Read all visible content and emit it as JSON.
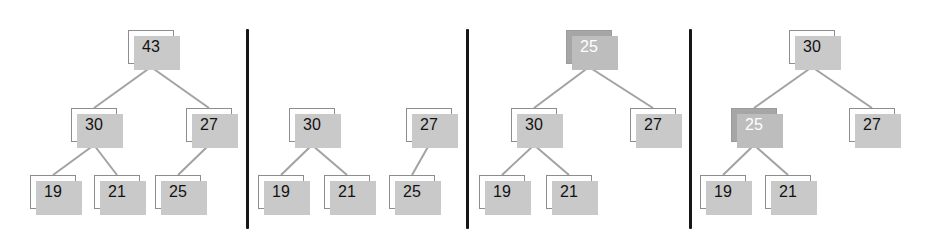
{
  "figure": {
    "title": "",
    "background_color": "#ffffff",
    "width": 935,
    "height": 239,
    "panel_count": 4,
    "divider_color": "#161616",
    "node_fill": "#fefefe",
    "node_border": "#8d8d8d",
    "node_shadow": "#c9c9c9",
    "highlight_fill": "#a6a6a6",
    "highlight_text": "#ffffff",
    "edge_color": "#a2a2a2"
  },
  "panels": [
    {
      "name": "panel-1-original-heap",
      "nodes": [
        {
          "id": "p1-43",
          "label": "43",
          "x": 128,
          "y": 30,
          "highlight": false
        },
        {
          "id": "p1-30",
          "label": "30",
          "x": 71,
          "y": 108,
          "highlight": false
        },
        {
          "id": "p1-27",
          "label": "27",
          "x": 186,
          "y": 108,
          "highlight": false
        },
        {
          "id": "p1-19",
          "label": "19",
          "x": 30,
          "y": 175,
          "highlight": false
        },
        {
          "id": "p1-21",
          "label": "21",
          "x": 94,
          "y": 175,
          "highlight": false
        },
        {
          "id": "p1-25",
          "label": "25",
          "x": 155,
          "y": 175,
          "highlight": false
        }
      ],
      "edges": [
        {
          "from": "p1-43",
          "to": "p1-30"
        },
        {
          "from": "p1-43",
          "to": "p1-27"
        },
        {
          "from": "p1-30",
          "to": "p1-19"
        },
        {
          "from": "p1-30",
          "to": "p1-21"
        },
        {
          "from": "p1-27",
          "to": "p1-25"
        }
      ]
    },
    {
      "name": "panel-2-root-removed",
      "nodes": [
        {
          "id": "p2-30",
          "label": "30",
          "x": 289,
          "y": 108,
          "highlight": false
        },
        {
          "id": "p2-27",
          "label": "27",
          "x": 406,
          "y": 108,
          "highlight": false
        },
        {
          "id": "p2-19",
          "label": "19",
          "x": 258,
          "y": 175,
          "highlight": false
        },
        {
          "id": "p2-21",
          "label": "21",
          "x": 324,
          "y": 175,
          "highlight": false
        },
        {
          "id": "p2-25",
          "label": "25",
          "x": 389,
          "y": 175,
          "highlight": false
        }
      ],
      "edges": [
        {
          "from": "p2-30",
          "to": "p2-19"
        },
        {
          "from": "p2-30",
          "to": "p2-21"
        },
        {
          "from": "p2-27",
          "to": "p2-25"
        }
      ]
    },
    {
      "name": "panel-3-last-node-moved-to-root",
      "nodes": [
        {
          "id": "p3-25",
          "label": "25",
          "x": 566,
          "y": 30,
          "highlight": true
        },
        {
          "id": "p3-30",
          "label": "30",
          "x": 511,
          "y": 108,
          "highlight": false
        },
        {
          "id": "p3-27",
          "label": "27",
          "x": 630,
          "y": 108,
          "highlight": false
        },
        {
          "id": "p3-19",
          "label": "19",
          "x": 479,
          "y": 175,
          "highlight": false
        },
        {
          "id": "p3-21",
          "label": "21",
          "x": 546,
          "y": 175,
          "highlight": false
        }
      ],
      "edges": [
        {
          "from": "p3-25",
          "to": "p3-30"
        },
        {
          "from": "p3-25",
          "to": "p3-27"
        },
        {
          "from": "p3-30",
          "to": "p3-19"
        },
        {
          "from": "p3-30",
          "to": "p3-21"
        }
      ]
    },
    {
      "name": "panel-4-after-sift-down",
      "nodes": [
        {
          "id": "p4-30",
          "label": "30",
          "x": 789,
          "y": 30,
          "highlight": false
        },
        {
          "id": "p4-25",
          "label": "25",
          "x": 731,
          "y": 108,
          "highlight": true
        },
        {
          "id": "p4-27",
          "label": "27",
          "x": 849,
          "y": 108,
          "highlight": false
        },
        {
          "id": "p4-19",
          "label": "19",
          "x": 700,
          "y": 175,
          "highlight": false
        },
        {
          "id": "p4-21",
          "label": "21",
          "x": 765,
          "y": 175,
          "highlight": false
        }
      ],
      "edges": [
        {
          "from": "p4-30",
          "to": "p4-25"
        },
        {
          "from": "p4-30",
          "to": "p4-27"
        },
        {
          "from": "p4-25",
          "to": "p4-19"
        },
        {
          "from": "p4-25",
          "to": "p4-21"
        }
      ]
    }
  ],
  "dividers": [
    {
      "name": "divider-1",
      "x": 246,
      "y": 29,
      "height": 200
    },
    {
      "name": "divider-2",
      "x": 466,
      "y": 29,
      "height": 200
    },
    {
      "name": "divider-3",
      "x": 689,
      "y": 29,
      "height": 200
    }
  ]
}
